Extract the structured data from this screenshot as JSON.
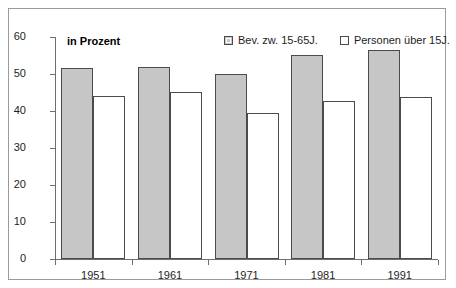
{
  "chart_data": {
    "type": "bar",
    "title": "in Prozent",
    "xlabel": "",
    "ylabel": "",
    "ylim": [
      0,
      60
    ],
    "yticks": [
      0,
      10,
      20,
      30,
      40,
      50,
      60
    ],
    "grid": false,
    "legend_position": "top-right",
    "categories": [
      "1951",
      "1961",
      "1971",
      "1981",
      "1991"
    ],
    "series": [
      {
        "name": "Bev. zw. 15-65J.",
        "color": "#c6c6c6",
        "values": [
          51.6,
          52.0,
          49.9,
          55.1,
          56.6
        ]
      },
      {
        "name": "Personen über 15J.",
        "color": "#ffffff",
        "values": [
          44.1,
          45.2,
          39.4,
          42.6,
          43.9
        ]
      }
    ]
  },
  "legend": {
    "items": [
      {
        "label": "Bev. zw. 15-65J.",
        "swatch": "filled-gray-square-icon"
      },
      {
        "label": "Personen über 15J.",
        "swatch": "empty-white-square-icon"
      }
    ]
  }
}
